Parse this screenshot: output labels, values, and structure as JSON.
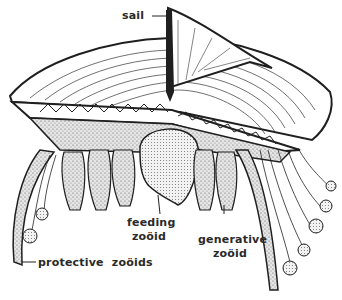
{
  "diagram": {
    "colors": {
      "ink": "#1f1f1f",
      "paper": "#ffffff",
      "stipple": "#b8b8b8"
    },
    "labels": {
      "sail": "sail",
      "feeding_zooid_line1": "feeding",
      "feeding_zooid_line2": "zoöid",
      "generative_zooid_line1": "generative",
      "generative_zooid_line2": "zoöid",
      "protective_zooids": "protective  zoöids"
    }
  }
}
